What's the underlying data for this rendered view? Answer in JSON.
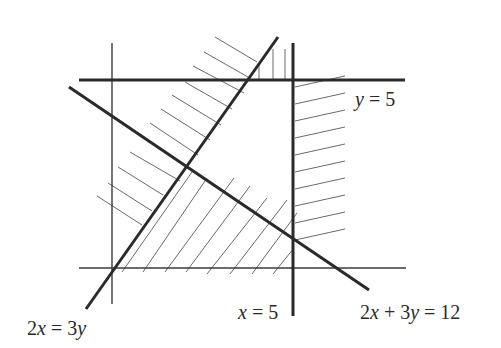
{
  "diagram": {
    "title": "",
    "type": "linear-inequality-regions",
    "lines": [
      {
        "id": "y-axis",
        "equation": "x = 0",
        "style": "thin"
      },
      {
        "id": "x-axis",
        "equation": "y = 0",
        "style": "thin"
      },
      {
        "id": "line-y5",
        "equation": "y = 5",
        "style": "thick"
      },
      {
        "id": "line-x5",
        "equation": "x = 5",
        "style": "thick"
      },
      {
        "id": "line-2x3y",
        "equation": "2x = 3y",
        "style": "thick"
      },
      {
        "id": "line-2x3y12",
        "equation": "2x + 3y = 12",
        "style": "thick"
      }
    ],
    "labels": {
      "y5": {
        "lhs": "y",
        "rhs": " = 5"
      },
      "x5": {
        "lhs": "x",
        "rhs": " = 5"
      },
      "eq2x3y12": {
        "a": "2",
        "x": "x",
        "mid": " + 3",
        "y": "y",
        "rhs": " = 12"
      },
      "eq2x3y": {
        "a": "2",
        "x": "x",
        "mid": " = 3",
        "y": "y"
      }
    },
    "shaded_regions_note": "Hatched regions mark unwanted side of each boundary; unshaded region is feasible",
    "colors": {
      "line": "#2a2a2a",
      "hatch": "#6a6a6a",
      "background": "#ffffff"
    }
  }
}
